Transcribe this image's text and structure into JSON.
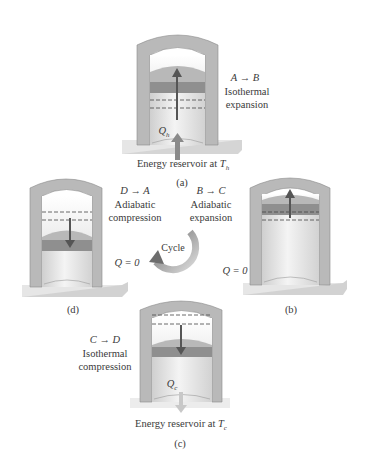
{
  "figure": {
    "colors": {
      "wall": "#b9b9b9",
      "wall_dark": "#9e9e9e",
      "gas": "#e4e4e4",
      "piston": "#8f8f8f",
      "piston_top": "#b4b4b4",
      "arrow": "#555555",
      "heat_arrow": "#8a8a8a",
      "cycle_arrow": "#8c8c8c",
      "base": "#e9e9e9"
    },
    "panels": {
      "a": {
        "tag": "(a)",
        "process": "A → B",
        "type_line1": "Isothermal",
        "type_line2": "expansion",
        "heat_label": "Qh",
        "heat_symbol": "Q",
        "heat_sub": "h",
        "reservoir_prefix": "Energy reservoir at ",
        "reservoir_symbol": "T",
        "reservoir_sub": "h"
      },
      "b": {
        "tag": "(b)",
        "process": "B → C",
        "type_line1": "Adiabatic",
        "type_line2": "expansion",
        "heat_label": "Q = 0"
      },
      "c": {
        "tag": "(c)",
        "process": "C → D",
        "type_line1": "Isothermal",
        "type_line2": "compression",
        "heat_label": "Qc",
        "heat_symbol": "Q",
        "heat_sub": "c",
        "reservoir_prefix": "Energy reservoir at ",
        "reservoir_symbol": "T",
        "reservoir_sub": "c"
      },
      "d": {
        "tag": "(d)",
        "process": "D → A",
        "type_line1": "Adiabatic",
        "type_line2": "compression",
        "heat_label": "Q = 0"
      }
    },
    "cycle_label": "Cycle"
  }
}
